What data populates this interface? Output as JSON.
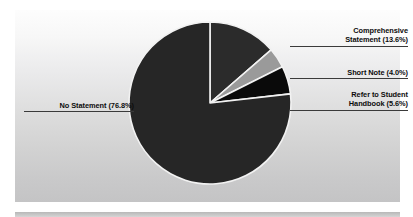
{
  "chart_data": {
    "type": "pie",
    "title": "",
    "subtitle": "",
    "xlabel": "",
    "ylabel": "",
    "legend_position": "callout-labels",
    "grid": false,
    "categories": [
      "Comprehensive Statement",
      "Short Note",
      "Refer to Student Handbook",
      "No Statement"
    ],
    "values": [
      13.6,
      4.0,
      5.6,
      76.8
    ],
    "value_unit": "%",
    "slice_colors": [
      "#2b2b2b",
      "#9a9a9a",
      "#0a0a0a",
      "#262626"
    ],
    "slice_border_color": "#f2f2f2",
    "slices": [
      {
        "name": "Comprehensive Statement",
        "value": 13.6,
        "label_line1": "Comprehensive",
        "label_line2": "Statement (13.6%)",
        "color": "#2b2b2b"
      },
      {
        "name": "Short Note",
        "value": 4.0,
        "label_line1": "Short Note (4.0%)",
        "label_line2": "",
        "color": "#9a9a9a"
      },
      {
        "name": "Refer to Student Handbook",
        "value": 5.6,
        "label_line1": "Refer to Student",
        "label_line2": "Handbook (5.6%)",
        "color": "#0a0a0a"
      },
      {
        "name": "No Statement",
        "value": 76.8,
        "label_line1": "No Statement (76.8%)",
        "label_line2": "",
        "color": "#262626"
      }
    ]
  },
  "labels": {
    "comprehensive": {
      "line1": "Comprehensive",
      "line2": "Statement (13.6%)"
    },
    "short_note": {
      "line1": "Short Note (4.0%)"
    },
    "refer_handbook": {
      "line1": "Refer to Student",
      "line2": "Handbook (5.6%)"
    },
    "no_statement": {
      "line1": "No Statement (76.8%)"
    }
  },
  "colors": {
    "comprehensive_statement": "#2b2b2b",
    "short_note": "#9a9a9a",
    "refer_to_student_handbook": "#0a0a0a",
    "no_statement": "#262626",
    "label_text": "#0c0c0c",
    "leader_line": "#3a3a3a",
    "panel_background_top": "#fdfdfd",
    "panel_background_bottom": "#c4c4c5"
  }
}
